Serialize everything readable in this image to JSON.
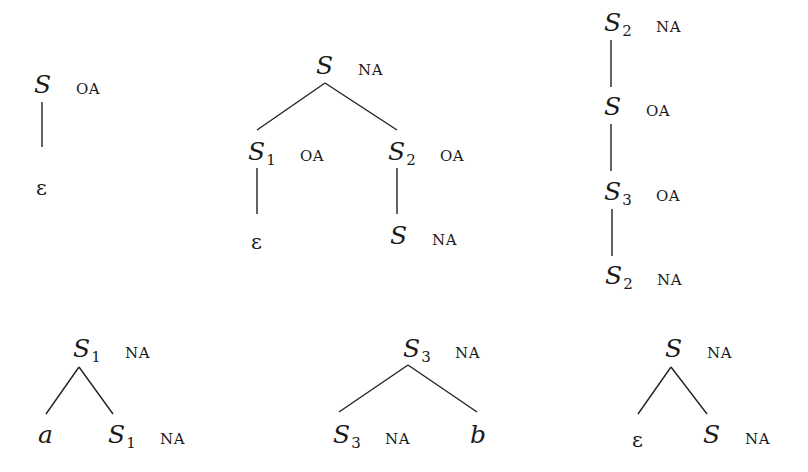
{
  "diagram": {
    "type": "elementary-trees",
    "trees": [
      {
        "id": "tree1",
        "nodes": [
          {
            "label": "S",
            "sub": "",
            "constraint": "OA",
            "x": 34,
            "y": 70
          },
          {
            "label": "ε",
            "sub": "",
            "constraint": "",
            "x": 36,
            "y": 176,
            "epsilon": true
          }
        ],
        "edges": [
          [
            42,
            102,
            42,
            147
          ]
        ]
      },
      {
        "id": "tree2",
        "nodes": [
          {
            "label": "S",
            "sub": "",
            "constraint": "NA",
            "x": 316,
            "y": 51
          },
          {
            "label": "S",
            "sub": "1",
            "constraint": "OA",
            "x": 248,
            "y": 137
          },
          {
            "label": "S",
            "sub": "2",
            "constraint": "OA",
            "x": 388,
            "y": 137
          },
          {
            "label": "ε",
            "sub": "",
            "constraint": "",
            "x": 251,
            "y": 230,
            "epsilon": true
          },
          {
            "label": "S",
            "sub": "",
            "constraint": "NA",
            "x": 390,
            "y": 221
          }
        ],
        "edges": [
          [
            325,
            83,
            257,
            130
          ],
          [
            325,
            83,
            397,
            130
          ],
          [
            257,
            168,
            257,
            214
          ],
          [
            397,
            168,
            397,
            214
          ]
        ]
      },
      {
        "id": "tree3",
        "nodes": [
          {
            "label": "S",
            "sub": "2",
            "constraint": "NA",
            "x": 604,
            "y": 8
          },
          {
            "label": "S",
            "sub": "",
            "constraint": "OA",
            "x": 604,
            "y": 92
          },
          {
            "label": "S",
            "sub": "3",
            "constraint": "OA",
            "x": 604,
            "y": 177
          },
          {
            "label": "S",
            "sub": "2",
            "constraint": "NA",
            "x": 605,
            "y": 261
          }
        ],
        "edges": [
          [
            611,
            40,
            611,
            87
          ],
          [
            611,
            124,
            611,
            171
          ],
          [
            612,
            209,
            612,
            256
          ]
        ]
      },
      {
        "id": "tree4",
        "nodes": [
          {
            "label": "S",
            "sub": "1",
            "constraint": "NA",
            "x": 73,
            "y": 334
          },
          {
            "label": "a",
            "sub": "",
            "constraint": "",
            "x": 38,
            "y": 420
          },
          {
            "label": "S",
            "sub": "1",
            "constraint": "NA",
            "x": 108,
            "y": 420
          }
        ],
        "edges": [
          [
            79,
            367,
            46,
            414
          ],
          [
            79,
            367,
            113,
            414
          ]
        ]
      },
      {
        "id": "tree5",
        "nodes": [
          {
            "label": "S",
            "sub": "3",
            "constraint": "NA",
            "x": 403,
            "y": 334
          },
          {
            "label": "S",
            "sub": "3",
            "constraint": "NA",
            "x": 333,
            "y": 420
          },
          {
            "label": "b",
            "sub": "",
            "constraint": "",
            "x": 470,
            "y": 420
          }
        ],
        "edges": [
          [
            408,
            365,
            339,
            412
          ],
          [
            408,
            365,
            477,
            412
          ]
        ]
      },
      {
        "id": "tree6",
        "nodes": [
          {
            "label": "S",
            "sub": "",
            "constraint": "NA",
            "x": 665,
            "y": 334
          },
          {
            "label": "ε",
            "sub": "",
            "constraint": "",
            "x": 632,
            "y": 428,
            "epsilon": true
          },
          {
            "label": "S",
            "sub": "",
            "constraint": "NA",
            "x": 703,
            "y": 420
          }
        ],
        "edges": [
          [
            671,
            367,
            638,
            414
          ],
          [
            671,
            367,
            707,
            414
          ]
        ]
      }
    ]
  }
}
